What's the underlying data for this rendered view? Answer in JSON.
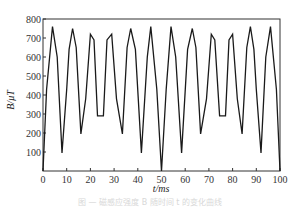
{
  "chart_data": {
    "type": "line",
    "title": "",
    "xlabel": "t/ms",
    "ylabel": "B/μT",
    "xlim": [
      0,
      100
    ],
    "ylim": [
      0,
      800
    ],
    "xticks": [
      0,
      10,
      20,
      30,
      40,
      50,
      60,
      70,
      80,
      90,
      100
    ],
    "yticks": [
      100,
      200,
      300,
      400,
      500,
      600,
      700,
      800
    ],
    "grid": false,
    "legend": null,
    "series": [
      {
        "name": "B",
        "color": "#1a1a1a",
        "x": [
          0,
          1.5,
          4,
          6,
          8,
          10,
          11,
          12.5,
          14,
          16,
          18,
          20,
          21.5,
          23,
          25.5,
          27,
          29,
          31,
          33.5,
          35.5,
          37,
          39,
          41.5,
          44,
          45.5,
          48,
          50,
          52,
          54,
          56,
          58.5,
          61,
          63,
          64.5,
          66.5,
          69,
          71,
          72.5,
          74.5,
          77,
          78.5,
          80,
          82,
          84,
          86,
          87.5,
          89,
          90,
          92,
          94,
          96,
          98.5,
          100
        ],
        "y": [
          0,
          430,
          760,
          600,
          95,
          430,
          640,
          750,
          650,
          195,
          380,
          720,
          690,
          290,
          290,
          690,
          720,
          380,
          195,
          650,
          750,
          640,
          95,
          600,
          760,
          430,
          0,
          430,
          760,
          600,
          95,
          640,
          750,
          650,
          195,
          380,
          720,
          690,
          290,
          290,
          690,
          720,
          380,
          195,
          650,
          760,
          640,
          430,
          95,
          600,
          760,
          430,
          0
        ]
      }
    ]
  },
  "axes": {
    "xlabel": "t/ms",
    "ylabel": "B/μT",
    "x_tick_labels": [
      "0",
      "10",
      "20",
      "30",
      "40",
      "50",
      "60",
      "70",
      "80",
      "90",
      "100"
    ],
    "y_tick_labels": [
      "100",
      "200",
      "300",
      "400",
      "500",
      "600",
      "700",
      "800"
    ]
  },
  "caption": "图 — 磁感应强度 B 随时间 t 的变化曲线"
}
